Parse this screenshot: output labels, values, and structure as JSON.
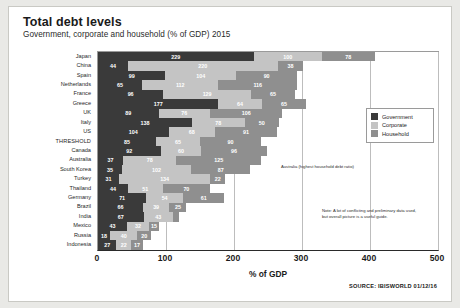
{
  "header": {
    "title": "Total debt levels",
    "subtitle": "Government, corporate and household  (% of GDP) 2015"
  },
  "axis": {
    "xlabel": "% of GDP",
    "ticks": [
      "0",
      "100",
      "200",
      "300",
      "400",
      "500"
    ]
  },
  "legend": {
    "items": [
      {
        "label": "Government",
        "color": "#3a3a3a"
      },
      {
        "label": "Corporate",
        "color": "#c4c4c4"
      },
      {
        "label": "Household",
        "color": "#8f8f8f"
      }
    ]
  },
  "annotations": {
    "australia": "Australia (highest household debt ratio)",
    "note": "Note: A lot of conflicting and preliminary data used, but overall picture is a useful guide."
  },
  "source": "SOURCE: IBISWORLD  01/12/16",
  "chart_data": {
    "type": "bar",
    "orientation": "horizontal",
    "stacked": true,
    "title": "Total debt levels",
    "subtitle": "Government, corporate and household  (% of GDP) 2015",
    "xlabel": "% of GDP",
    "ylabel": "",
    "xlim": [
      0,
      500
    ],
    "xticks": [
      0,
      100,
      200,
      300,
      400,
      500
    ],
    "grid": true,
    "legend_position": "right",
    "categories": [
      "Japan",
      "China",
      "Spain",
      "Netherlands",
      "France",
      "Greece",
      "UK",
      "Italy",
      "US",
      "THRESHOLD",
      "Canada",
      "Australia",
      "South Korea",
      "Turkey",
      "Thailand",
      "Germany",
      "Brazil",
      "India",
      "Mexico",
      "Russia",
      "Indonesia"
    ],
    "series": [
      {
        "name": "Government",
        "color": "#3a3a3a",
        "values": [
          229,
          44,
          99,
          65,
          96,
          177,
          89,
          138,
          104,
          85,
          92,
          37,
          35,
          31,
          44,
          71,
          66,
          67,
          43,
          18,
          27
        ]
      },
      {
        "name": "Corporate",
        "color": "#c4c4c4",
        "values": [
          100,
          220,
          104,
          112,
          129,
          64,
          76,
          78,
          68,
          65,
          60,
          78,
          102,
          134,
          51,
          54,
          39,
          43,
          32,
          40,
          22
        ]
      },
      {
        "name": "Household",
        "color": "#8f8f8f",
        "values": [
          78,
          38,
          90,
          116,
          65,
          65,
          106,
          50,
          91,
          90,
          96,
          125,
          87,
          22,
          70,
          61,
          25,
          9,
          15,
          20,
          17
        ]
      }
    ]
  }
}
